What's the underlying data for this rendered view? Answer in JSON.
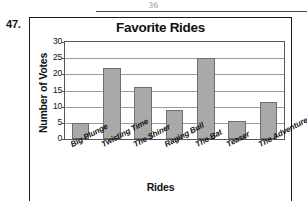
{
  "page": {
    "page_number": "36",
    "problem_number": "47."
  },
  "chart_data": {
    "type": "bar",
    "title": "Favorite Rides",
    "xlabel": "Rides",
    "ylabel": "Number of Votes",
    "categories": [
      "Big Plunge",
      "Twisting Time",
      "The Shiner",
      "Raging Bull",
      "The Bat",
      "Teaser",
      "The Adventure"
    ],
    "values": [
      5,
      22,
      16,
      9,
      25,
      5.5,
      11.5
    ],
    "ylim": [
      0,
      30
    ],
    "ytick_labels": [
      "0",
      "5",
      "10",
      "15",
      "20",
      "25",
      "30"
    ],
    "ytick_values": [
      0,
      5,
      10,
      15,
      20,
      25,
      30
    ],
    "grid": true,
    "legend": "none",
    "bar_color": "#a9a9a9",
    "bar_edge_color": "#6e6e6e",
    "axis_color": "#55555a",
    "grid_color": "#9a9aa0"
  }
}
